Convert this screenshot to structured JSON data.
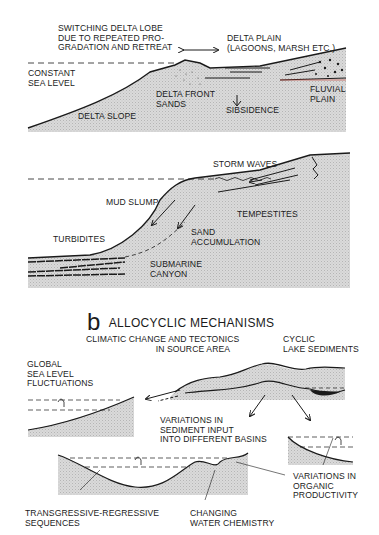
{
  "colors": {
    "sediment_fill": "#d8d8d8",
    "line": "#1a1a1a",
    "accent_red": "#c0392b",
    "background": "#ffffff"
  },
  "panel_a_top": {
    "labels": {
      "switching": "SWITCHING DELTA LOBE\nDUE TO REPEATED PRO-\nGRADATION AND RETREAT",
      "delta_plain": "DELTA PLAIN\n(LAGOONS, MARSH ETC.)",
      "constant_sea_level": "CONSTANT\nSEA LEVEL",
      "delta_front_sands": "DELTA FRONT\nSANDS",
      "subsidence": "SIBSIDENCE",
      "fluvial_plain": "FLUVIAL\nPLAIN",
      "delta_slope": "DELTA SLOPE"
    }
  },
  "panel_a_bottom": {
    "labels": {
      "storm_waves": "STORM WAVES",
      "mud_slump": "MUD SLUMP",
      "tempestites": "TEMPESTITES",
      "sand_accumulation": "SAND\nACCUMULATION",
      "turbidites": "TURBIDITES",
      "submarine_canyon": "SUBMARINE\nCANYON"
    }
  },
  "panel_b": {
    "letter": "b",
    "title": "ALLOCYCLIC MECHANISMS",
    "labels": {
      "climatic": "CLIMATIC CHANGE AND TECTONICS\n                            IN SOURCE AREA",
      "cyclic_lake": "CYCLIC\nLAKE SEDIMENTS",
      "global_sea": "GLOBAL\nSEA LEVEL\nFLUCTUATIONS",
      "variations_sediment": "VARIATIONS IN\nSEDIMENT INPUT\nINTO DIFFERENT BASINS",
      "variations_organic": "VARIATIONS IN\nORGANIC\nPRODUCTIVITY",
      "transgressive": "TRANSGRESSIVE-REGRESSIVE\nSEQUENCES",
      "water_chemistry": "CHANGING\nWATER CHEMISTRY"
    }
  }
}
